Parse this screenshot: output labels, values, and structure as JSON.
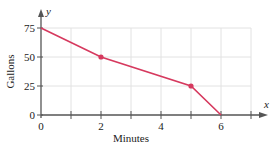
{
  "chart_data": {
    "type": "line",
    "title": "",
    "xlabel": "Minutes",
    "ylabel": "Gallons",
    "x_axis_var": "x",
    "y_axis_var": "y",
    "x": [
      0,
      2,
      5,
      6
    ],
    "series": [
      {
        "name": "Gallons",
        "values": [
          75,
          50,
          25,
          0
        ],
        "marked_points": [
          [
            2,
            50
          ],
          [
            5,
            25
          ]
        ]
      }
    ],
    "xlim": [
      0,
      7
    ],
    "ylim": [
      0,
      75
    ],
    "x_ticks": [
      0,
      1,
      2,
      3,
      4,
      5,
      6,
      7
    ],
    "x_tick_labels": [
      "0",
      "2",
      "4",
      "6"
    ],
    "x_tick_label_values": [
      0,
      2,
      4,
      6
    ],
    "y_ticks": [
      0,
      25,
      50,
      75
    ],
    "y_tick_labels": [
      "0",
      "25",
      "50",
      "75"
    ],
    "grid": true,
    "line_color": "#d6395e",
    "axis_color": "#555555",
    "grid_color": "#e2e2e2"
  }
}
